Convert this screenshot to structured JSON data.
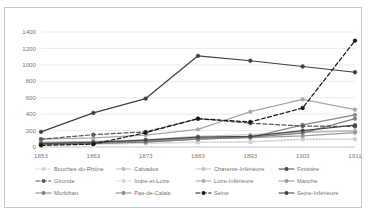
{
  "chart_data": {
    "type": "line",
    "title": "",
    "xlabel": "",
    "ylabel": "",
    "x": [
      1853,
      1863,
      1873,
      1883,
      1893,
      1903,
      1911
    ],
    "xtick_labels": [
      "1853",
      "1863",
      "1873",
      "1883",
      "1893",
      "1903",
      "1911"
    ],
    "ytick_labels": [
      "0",
      "200",
      "400",
      "600",
      "800",
      "1000",
      "1200",
      "1400"
    ],
    "ylim": [
      0,
      1400
    ],
    "ytick_step": 200,
    "grid": "horizontal",
    "legend_position": "bottom",
    "series": [
      {
        "name": "Bouches-du-Rhône",
        "color": "#d0d0d0",
        "dash": "dotted",
        "marker": "circle",
        "values": [
          25,
          35,
          45,
          60,
          62,
          100,
          95
        ]
      },
      {
        "name": "Calvados",
        "color": "#bdbdbd",
        "dash": "solid",
        "marker": "circle",
        "values": [
          60,
          70,
          80,
          110,
          120,
          175,
          195
        ]
      },
      {
        "name": "Charente-Inférieure",
        "color": "#c4c4c4",
        "dash": "solid",
        "marker": "circle",
        "values": [
          55,
          65,
          90,
          130,
          150,
          185,
          200
        ]
      },
      {
        "name": "Finistère",
        "color": "#4a4a4a",
        "dash": "solid",
        "marker": "circle",
        "values": [
          40,
          55,
          85,
          120,
          130,
          200,
          265
        ]
      },
      {
        "name": "Gironde",
        "color": "#5a5a5a",
        "dash": "dashed",
        "marker": "circle",
        "values": [
          95,
          150,
          185,
          345,
          290,
          255,
          250
        ]
      },
      {
        "name": "Indre-et-Loire",
        "color": "#d6d6d6",
        "dash": "dotted",
        "marker": "circle",
        "values": [
          30,
          38,
          45,
          55,
          60,
          90,
          95
        ]
      },
      {
        "name": "Loire-Inférieure",
        "color": "#a8a8a8",
        "dash": "solid",
        "marker": "circle",
        "values": [
          95,
          110,
          145,
          215,
          430,
          580,
          455
        ]
      },
      {
        "name": "Manche",
        "color": "#9a9a9a",
        "dash": "solid",
        "marker": "circle",
        "values": [
          50,
          60,
          75,
          105,
          115,
          135,
          175
        ]
      },
      {
        "name": "Morbihan",
        "color": "#828282",
        "dash": "solid",
        "marker": "circle",
        "values": [
          30,
          45,
          60,
          95,
          120,
          170,
          345
        ]
      },
      {
        "name": "Pas-de-Calais",
        "color": "#888888",
        "dash": "solid",
        "marker": "circle",
        "values": [
          35,
          48,
          62,
          95,
          118,
          270,
          390
        ]
      },
      {
        "name": "Seine",
        "color": "#1a1a1a",
        "dash": "dashed",
        "marker": "circle",
        "values": [
          20,
          35,
          175,
          345,
          305,
          475,
          1295
        ]
      },
      {
        "name": "Seine-Inférieure",
        "color": "#404040",
        "dash": "solid",
        "marker": "circle",
        "values": [
          185,
          415,
          590,
          1110,
          1050,
          980,
          910
        ]
      }
    ]
  },
  "legend": {
    "rows": [
      [
        "Bouches-du-Rhône",
        "Calvados",
        "Charente-Inférieure",
        "Finistère"
      ],
      [
        "Gironde",
        "Indre-et-Loire",
        "Loire-Inférieure",
        "Manche"
      ],
      [
        "Morbihan",
        "Pas-de-Calais",
        "Seine",
        "Seine-Inférieure"
      ]
    ]
  },
  "colors": {
    "grid": "#e3e3e3",
    "axis": "#c8c8c8",
    "tick_text": "#7a7a7a",
    "frame": "#c8c8c8",
    "background": "#ffffff"
  }
}
